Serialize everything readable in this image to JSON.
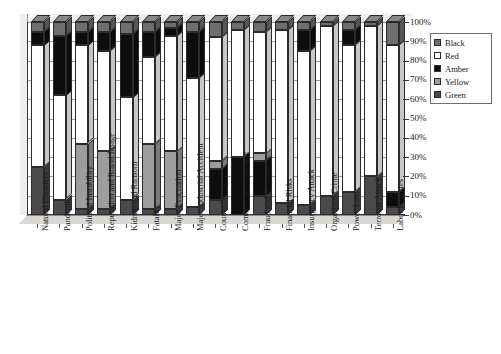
{
  "chart_data": {
    "type": "bar",
    "subtype": "stacked-100-percent-3d",
    "title": "",
    "xlabel": "",
    "ylabel": "",
    "ylim": [
      0,
      100
    ],
    "ytick_labels": [
      "0%",
      "10%",
      "20%",
      "30%",
      "40%",
      "50%",
      "60%",
      "70%",
      "80%",
      "90%",
      "100%"
    ],
    "ytick_values": [
      0,
      10,
      20,
      30,
      40,
      50,
      60,
      70,
      80,
      90,
      100
    ],
    "ytick_label_position": "right",
    "grid": true,
    "legend_position": "right",
    "legend": [
      "Black",
      "Red",
      "Amber",
      "Yellow",
      "Green"
    ],
    "series_colors": {
      "Black": "#6e6e6e",
      "Red": "#ffffff",
      "Amber": "#0d0d0d",
      "Yellow": "#9d9d9d",
      "Green": "#4a4a4a"
    },
    "categories": [
      "Natural Disasters",
      "Pandemic",
      "Political Instability",
      "Reputation and Brand Image",
      "Kidnap and Ransom",
      "Fatality",
      "Major Evacuation",
      "Major Industrial Accident",
      "Counterfeiting",
      "Commercial Espionage",
      "Fraud and Corruption",
      "Financial Risks",
      "Insurgency Attack",
      "Organized Crime",
      "Power Loss",
      "Terrorist Attack",
      "Labor Disputes"
    ],
    "series": [
      {
        "name": "Green",
        "values": [
          25,
          8,
          3,
          3,
          8,
          3,
          3,
          4,
          8,
          0,
          10,
          6,
          5,
          10,
          12,
          20,
          4
        ]
      },
      {
        "name": "Yellow",
        "values": [
          0,
          0,
          34,
          30,
          0,
          34,
          30,
          0,
          4,
          0,
          4,
          0,
          0,
          0,
          0,
          0,
          0
        ]
      },
      {
        "name": "Amber",
        "values": [
          0,
          0,
          0,
          0,
          0,
          0,
          0,
          0,
          16,
          30,
          18,
          0,
          0,
          0,
          0,
          0,
          8
        ]
      },
      {
        "name": "Red",
        "values": [
          63,
          54,
          35,
          42,
          53,
          45,
          60,
          67,
          50,
          38,
          42,
          83,
          80,
          88,
          76,
          78,
          76
        ]
      },
      {
        "name": "Black",
        "values": [
          12,
          38,
          28,
          25,
          39,
          18,
          7,
          29,
          22,
          32,
          26,
          11,
          15,
          2,
          12,
          2,
          12
        ]
      }
    ],
    "stack_order_bottom_to_top": [
      "Green",
      "Yellow",
      "Amber",
      "Red",
      "Black"
    ],
    "bar_segments": [
      {
        "category": "Natural Disasters",
        "segments": [
          {
            "name": "Green",
            "from": 0,
            "to": 25
          },
          {
            "name": "Red",
            "from": 25,
            "to": 88
          },
          {
            "name": "Amber",
            "from": 88,
            "to": 95
          },
          {
            "name": "Black",
            "from": 95,
            "to": 100
          }
        ]
      },
      {
        "category": "Pandemic",
        "segments": [
          {
            "name": "Green",
            "from": 0,
            "to": 8
          },
          {
            "name": "Red",
            "from": 8,
            "to": 62
          },
          {
            "name": "Amber",
            "from": 62,
            "to": 93
          },
          {
            "name": "Black",
            "from": 93,
            "to": 100
          }
        ]
      },
      {
        "category": "Political Instability",
        "segments": [
          {
            "name": "Green",
            "from": 0,
            "to": 3
          },
          {
            "name": "Yellow",
            "from": 3,
            "to": 37
          },
          {
            "name": "Red",
            "from": 37,
            "to": 88
          },
          {
            "name": "Amber",
            "from": 88,
            "to": 95
          },
          {
            "name": "Black",
            "from": 95,
            "to": 100
          }
        ]
      },
      {
        "category": "Reputation and Brand Image",
        "segments": [
          {
            "name": "Green",
            "from": 0,
            "to": 3
          },
          {
            "name": "Yellow",
            "from": 3,
            "to": 33
          },
          {
            "name": "Red",
            "from": 33,
            "to": 85
          },
          {
            "name": "Amber",
            "from": 85,
            "to": 95
          },
          {
            "name": "Black",
            "from": 95,
            "to": 100
          }
        ]
      },
      {
        "category": "Kidnap and Ransom",
        "segments": [
          {
            "name": "Green",
            "from": 0,
            "to": 8
          },
          {
            "name": "Red",
            "from": 8,
            "to": 61
          },
          {
            "name": "Amber",
            "from": 61,
            "to": 94
          },
          {
            "name": "Black",
            "from": 94,
            "to": 100
          }
        ]
      },
      {
        "category": "Fatality",
        "segments": [
          {
            "name": "Green",
            "from": 0,
            "to": 3
          },
          {
            "name": "Yellow",
            "from": 3,
            "to": 37
          },
          {
            "name": "Red",
            "from": 37,
            "to": 82
          },
          {
            "name": "Amber",
            "from": 82,
            "to": 95
          },
          {
            "name": "Black",
            "from": 95,
            "to": 100
          }
        ]
      },
      {
        "category": "Major Evacuation",
        "segments": [
          {
            "name": "Green",
            "from": 0,
            "to": 3
          },
          {
            "name": "Yellow",
            "from": 3,
            "to": 33
          },
          {
            "name": "Red",
            "from": 33,
            "to": 93
          },
          {
            "name": "Amber",
            "from": 93,
            "to": 97
          },
          {
            "name": "Black",
            "from": 97,
            "to": 100
          }
        ]
      },
      {
        "category": "Major Industrial Accident",
        "segments": [
          {
            "name": "Green",
            "from": 0,
            "to": 4
          },
          {
            "name": "Red",
            "from": 4,
            "to": 71
          },
          {
            "name": "Amber",
            "from": 71,
            "to": 95
          },
          {
            "name": "Black",
            "from": 95,
            "to": 100
          }
        ]
      },
      {
        "category": "Counterfeiting",
        "segments": [
          {
            "name": "Green",
            "from": 0,
            "to": 8
          },
          {
            "name": "Amber",
            "from": 8,
            "to": 24
          },
          {
            "name": "Yellow",
            "from": 24,
            "to": 28
          },
          {
            "name": "Red",
            "from": 28,
            "to": 92
          },
          {
            "name": "Black",
            "from": 92,
            "to": 100
          }
        ]
      },
      {
        "category": "Commercial Espionage",
        "segments": [
          {
            "name": "Amber",
            "from": 0,
            "to": 30
          },
          {
            "name": "Red",
            "from": 30,
            "to": 96
          },
          {
            "name": "Black",
            "from": 96,
            "to": 100
          }
        ]
      },
      {
        "category": "Fraud and Corruption",
        "segments": [
          {
            "name": "Green",
            "from": 0,
            "to": 10
          },
          {
            "name": "Amber",
            "from": 10,
            "to": 28
          },
          {
            "name": "Yellow",
            "from": 28,
            "to": 32
          },
          {
            "name": "Red",
            "from": 32,
            "to": 95
          },
          {
            "name": "Black",
            "from": 95,
            "to": 100
          }
        ]
      },
      {
        "category": "Financial Risks",
        "segments": [
          {
            "name": "Green",
            "from": 0,
            "to": 6
          },
          {
            "name": "Red",
            "from": 6,
            "to": 96
          },
          {
            "name": "Black",
            "from": 96,
            "to": 100
          }
        ]
      },
      {
        "category": "Insurgency Attack",
        "segments": [
          {
            "name": "Green",
            "from": 0,
            "to": 5
          },
          {
            "name": "Red",
            "from": 5,
            "to": 85
          },
          {
            "name": "Amber",
            "from": 85,
            "to": 96
          },
          {
            "name": "Black",
            "from": 96,
            "to": 100
          }
        ]
      },
      {
        "category": "Organized Crime",
        "segments": [
          {
            "name": "Green",
            "from": 0,
            "to": 10
          },
          {
            "name": "Red",
            "from": 10,
            "to": 98
          },
          {
            "name": "Black",
            "from": 98,
            "to": 100
          }
        ]
      },
      {
        "category": "Power Loss",
        "segments": [
          {
            "name": "Green",
            "from": 0,
            "to": 12
          },
          {
            "name": "Red",
            "from": 12,
            "to": 88
          },
          {
            "name": "Amber",
            "from": 88,
            "to": 96
          },
          {
            "name": "Black",
            "from": 96,
            "to": 100
          }
        ]
      },
      {
        "category": "Terrorist Attack",
        "segments": [
          {
            "name": "Green",
            "from": 0,
            "to": 20
          },
          {
            "name": "Red",
            "from": 20,
            "to": 98
          },
          {
            "name": "Black",
            "from": 98,
            "to": 100
          }
        ]
      },
      {
        "category": "Labor Disputes",
        "segments": [
          {
            "name": "Green",
            "from": 0,
            "to": 4
          },
          {
            "name": "Amber",
            "from": 4,
            "to": 12
          },
          {
            "name": "Red",
            "from": 12,
            "to": 88
          },
          {
            "name": "Black",
            "from": 88,
            "to": 100
          }
        ]
      }
    ]
  }
}
